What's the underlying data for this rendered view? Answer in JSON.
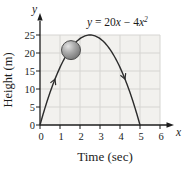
{
  "chart_data": {
    "type": "line",
    "title": "",
    "equation_label": "y = 20x − 4x²",
    "equation_parts": [
      {
        "t": "y",
        "i": true
      },
      {
        "t": " = 20",
        "i": false
      },
      {
        "t": "x",
        "i": true
      },
      {
        "t": " − 4",
        "i": false
      },
      {
        "t": "x",
        "i": true
      },
      {
        "t": "2",
        "i": true,
        "sup": true
      }
    ],
    "xlabel": "Time (sec)",
    "ylabel": "Height (m)",
    "x_axis_letter": "x",
    "y_axis_letter": "y",
    "xlim": [
      0,
      6
    ],
    "ylim": [
      0,
      25
    ],
    "x_ticks": [
      0,
      1,
      2,
      3,
      4,
      5,
      6
    ],
    "y_ticks": [
      0,
      5,
      10,
      15,
      20,
      25
    ],
    "grid": true,
    "legend": "none",
    "curve": {
      "coefficients": {
        "a": -4,
        "b": 20,
        "c": 0
      },
      "x_range": [
        0,
        5
      ],
      "vertex": [
        2.5,
        25
      ],
      "points": [
        [
          0,
          0
        ],
        [
          0.5,
          9
        ],
        [
          1,
          16
        ],
        [
          1.5,
          21
        ],
        [
          2,
          24
        ],
        [
          2.5,
          25
        ],
        [
          3,
          24
        ],
        [
          3.5,
          21
        ],
        [
          4,
          16
        ],
        [
          4.5,
          9
        ],
        [
          5,
          0
        ]
      ]
    },
    "direction_arrows": [
      {
        "x": 0.75,
        "branch": "rising"
      },
      {
        "x": 4.25,
        "branch": "falling"
      }
    ],
    "ball_marker": {
      "x": 1.55,
      "y": 20.8,
      "radius_px": 9.5
    }
  },
  "colors": {
    "page_bg": "#ffffff",
    "plot_bg": "#f2f1ee",
    "gridline": "#d6d5d2",
    "axis": "#1c1c1c",
    "curve": "#2b2b2b",
    "text": "#1c1c1c",
    "ball_highlight": "#e3e3e3",
    "ball_mid": "#a8a8a8",
    "ball_dark": "#6e6e6e",
    "ball_outline": "#4d4d4d"
  }
}
